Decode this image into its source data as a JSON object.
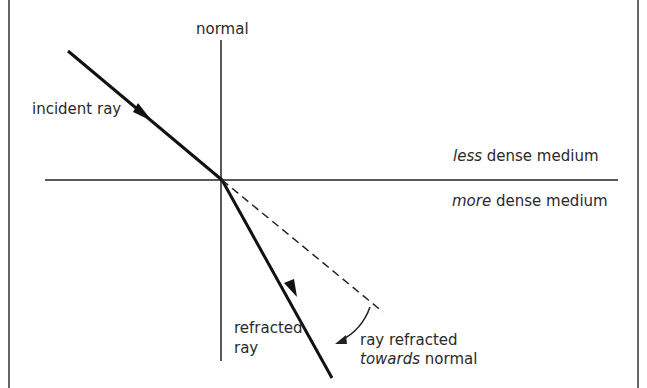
{
  "labels": {
    "normal": "normal",
    "incident_ray": "incident ray",
    "less_em": "less",
    "less_rest": " dense medium",
    "more_em": "more",
    "more_rest": " dense medium",
    "refracted_1": "refracted",
    "refracted_2": "ray",
    "towards_1": "ray refracted",
    "towards_em": "towards",
    "towards_rest": " normal"
  },
  "colors": {
    "line": "#1a1a1a",
    "border": "#333333"
  }
}
